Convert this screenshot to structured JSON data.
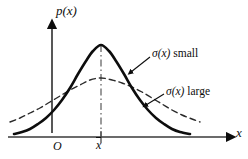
{
  "figure": {
    "kind": "probability-density-diagram",
    "background_color": "#ffffff",
    "stroke_color": "#0d0d0d",
    "axes": {
      "y_axis_label": "p(x)",
      "x_axis_label": "x",
      "origin_label": "O",
      "mean_tick_label": "x",
      "mean_tick_overbar": true
    },
    "annotations": {
      "small_sigma_symbol": "σ",
      "small_sigma_arg": "(x)",
      "small_sigma_text": " small",
      "large_sigma_symbol": "σ",
      "large_sigma_arg": "(x)",
      "large_sigma_text": " large"
    }
  },
  "chart_data": {
    "type": "line",
    "title": "",
    "xlabel": "x",
    "ylabel": "p(x)",
    "grid": false,
    "legend_position": "inline-annotations",
    "axis_style": "arrow-headed, unscaled schematic axes",
    "xlim": [
      0,
      248
    ],
    "ylim": [
      0,
      159
    ],
    "mean_x_pixel": 101,
    "baseline_y_pixel": 137,
    "y_axis_x_pixel": 52,
    "center_line": {
      "style": "dash-dot",
      "from_y_pixel": 45,
      "to_y_pixel": 137,
      "at_x_pixel": 101
    },
    "series": [
      {
        "name": "σ(x) small",
        "style": "solid",
        "stroke_width": 2.6,
        "description": "narrow tall gaussian, larger peak, faster decaying tails",
        "peak_xy_pixel": [
          101,
          45
        ],
        "sigma_pixels": 26,
        "points_pixel": [
          [
            14,
            134
          ],
          [
            22,
            132
          ],
          [
            30,
            129
          ],
          [
            38,
            124
          ],
          [
            46,
            118
          ],
          [
            54,
            110
          ],
          [
            62,
            100
          ],
          [
            70,
            88
          ],
          [
            78,
            74
          ],
          [
            86,
            61
          ],
          [
            93,
            51
          ],
          [
            101,
            45
          ],
          [
            109,
            51
          ],
          [
            116,
            61
          ],
          [
            124,
            74
          ],
          [
            132,
            88
          ],
          [
            140,
            100
          ],
          [
            148,
            110
          ],
          [
            156,
            118
          ],
          [
            164,
            124
          ],
          [
            172,
            129
          ],
          [
            180,
            132
          ],
          [
            190,
            134
          ]
        ]
      },
      {
        "name": "σ(x) large",
        "style": "dashed",
        "stroke_width": 1.4,
        "description": "wide flat gaussian, lower peak, slowly decaying tails",
        "peak_xy_pixel": [
          101,
          78
        ],
        "sigma_pixels": 46,
        "points_pixel": [
          [
            10,
            122
          ],
          [
            20,
            118
          ],
          [
            30,
            113
          ],
          [
            40,
            108
          ],
          [
            50,
            102
          ],
          [
            60,
            96
          ],
          [
            70,
            90
          ],
          [
            80,
            85
          ],
          [
            90,
            80
          ],
          [
            101,
            78
          ],
          [
            112,
            80
          ],
          [
            122,
            83
          ],
          [
            132,
            87
          ],
          [
            142,
            92
          ],
          [
            152,
            98
          ],
          [
            162,
            104
          ],
          [
            172,
            110
          ],
          [
            182,
            115
          ],
          [
            192,
            119
          ],
          [
            200,
            122
          ]
        ]
      }
    ],
    "annotations": [
      {
        "text": "σ(x) small",
        "label_xy_pixel": [
          152,
          54
        ],
        "leader_from_pixel": [
          150,
          57
        ],
        "leader_to_pixel": [
          131,
          72
        ],
        "arrowhead": true,
        "points_at_series": "σ(x) small"
      },
      {
        "text": "σ(x) large",
        "label_xy_pixel": [
          166,
          92
        ],
        "leader_from_pixel": [
          164,
          94
        ],
        "leader_to_pixel": [
          146,
          105
        ],
        "arrowhead": true,
        "points_at_series": "σ(x) large"
      }
    ]
  }
}
